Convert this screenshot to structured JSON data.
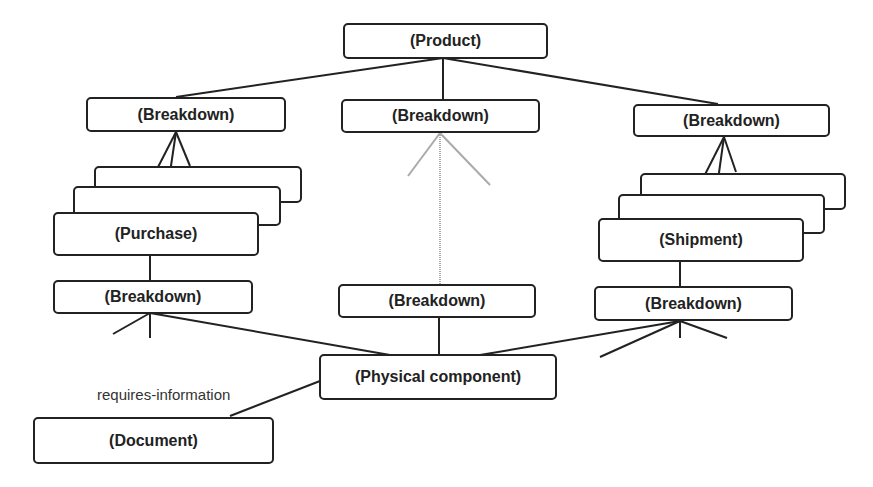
{
  "diagram": {
    "nodes": {
      "product": "(Product)",
      "breakdown_left": "(Breakdown)",
      "breakdown_center": "(Breakdown)",
      "breakdown_right": "(Breakdown)",
      "purchase": "(Purchase)",
      "shipment": "(Shipment)",
      "breakdown_left_lower": "(Breakdown)",
      "breakdown_center_lower": "(Breakdown)",
      "breakdown_right_lower": "(Breakdown)",
      "physical_component": "(Physical component)",
      "document": "(Document)"
    },
    "edge_labels": {
      "requires_information": "requires-information"
    },
    "colors": {
      "line": "#222222",
      "faded_line": "#aaaaaa"
    }
  }
}
